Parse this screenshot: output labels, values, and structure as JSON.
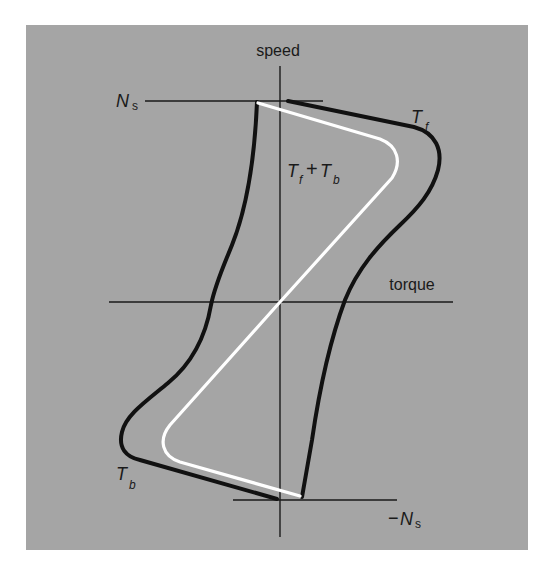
{
  "figure": {
    "type": "diagram",
    "colors": {
      "page_background": "#ffffff",
      "panel_background": "#a5a5a5",
      "axis": "#1a1a1a",
      "forward_backward_curves": "#111111",
      "resultant_curve": "#ffffff",
      "text": "#1a1a1a"
    },
    "axes": {
      "vertical": {
        "label": "speed"
      },
      "horizontal": {
        "label": "torque"
      }
    },
    "reference_lines": {
      "top": {
        "label_main": "N",
        "label_sub": "s"
      },
      "bottom": {
        "label_prefix": "−",
        "label_main": "N",
        "label_sub": "s"
      }
    },
    "curves": {
      "forward": {
        "label_main": "T",
        "label_sub": "f"
      },
      "backward": {
        "label_main": "T",
        "label_sub": "b"
      },
      "resultant": {
        "label_main_1": "T",
        "label_sub_1": "f",
        "label_op": "+",
        "label_main_2": "T",
        "label_sub_2": "b"
      }
    }
  }
}
